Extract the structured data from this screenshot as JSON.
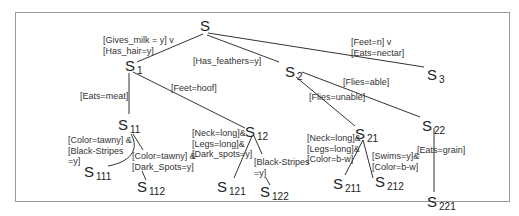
{
  "diagram": {
    "type": "decision-tree",
    "root": {
      "name": "S",
      "sub": ""
    },
    "nodes": [
      {
        "id": "S",
        "name": "S",
        "sub": ""
      },
      {
        "id": "S1",
        "name": "S",
        "sub": "1"
      },
      {
        "id": "S2",
        "name": "S",
        "sub": "2"
      },
      {
        "id": "S3",
        "name": "S",
        "sub": "3"
      },
      {
        "id": "S11",
        "name": "S",
        "sub": "11"
      },
      {
        "id": "S12",
        "name": "S",
        "sub": "12"
      },
      {
        "id": "S111",
        "name": "S",
        "sub": "111"
      },
      {
        "id": "S112",
        "name": "S",
        "sub": "112"
      },
      {
        "id": "S121",
        "name": "S",
        "sub": "121"
      },
      {
        "id": "S122",
        "name": "S",
        "sub": "122"
      },
      {
        "id": "S21",
        "name": "S",
        "sub": "21"
      },
      {
        "id": "S22",
        "name": "S",
        "sub": "22"
      },
      {
        "id": "S211",
        "name": "S",
        "sub": "211"
      },
      {
        "id": "S212",
        "name": "S",
        "sub": "212"
      },
      {
        "id": "S221",
        "name": "S",
        "sub": "221"
      }
    ],
    "edges": [
      {
        "from": "S",
        "to": "S1",
        "label": "[Gives_milk = y] v\n[Has_hair=y]"
      },
      {
        "from": "S",
        "to": "S2",
        "label": "[Has_feathers=y]"
      },
      {
        "from": "S",
        "to": "S3",
        "label": "[Feet=n] v\n[Eats=nectar]"
      },
      {
        "from": "S1",
        "to": "S11",
        "label": "[Eats=meat]"
      },
      {
        "from": "S1",
        "to": "S12",
        "label": "[Feet=hoof]"
      },
      {
        "from": "S11",
        "to": "S111",
        "label": "[Color=tawny] &\n[Black-Stripes\n=y]"
      },
      {
        "from": "S11",
        "to": "S112",
        "label": "[Color=tawny] &\n[Dark_Spots=y]"
      },
      {
        "from": "S12",
        "to": "S121",
        "label": "[Neck=long]&\n[Legs=long]&\n[Dark_spots=y]"
      },
      {
        "from": "S12",
        "to": "S122",
        "label": "[Black-Stripes\n=y]"
      },
      {
        "from": "S2",
        "to": "S21",
        "label": "[Flies=unable]"
      },
      {
        "from": "S2",
        "to": "S22",
        "label": "[Flies=able]"
      },
      {
        "from": "S21",
        "to": "S211",
        "label": "[Neck=long]&\n[Legs=long]&\n[Color=b-w]"
      },
      {
        "from": "S21",
        "to": "S212",
        "label": "[Swims=y]&\n[Color=b-w]"
      },
      {
        "from": "S22",
        "to": "S221",
        "label": "[Eats=grain]"
      }
    ]
  }
}
